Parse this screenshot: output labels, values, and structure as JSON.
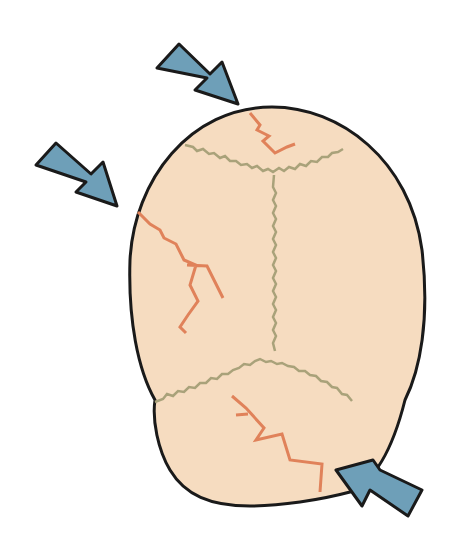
{
  "colors": {
    "background": "#ffffff",
    "skull_fill": "#f6dcc0",
    "outline": "#1a1a1a",
    "suture": "#a9a27a",
    "fracture": "#e0825a",
    "arrow_fill": "#6e9fb8",
    "arrow_stroke": "#1a1a1a"
  },
  "arrows": [
    {
      "name": "arrow-top",
      "direction": "down-right"
    },
    {
      "name": "arrow-left",
      "direction": "down-right"
    },
    {
      "name": "arrow-bottom-right",
      "direction": "up-left"
    }
  ]
}
